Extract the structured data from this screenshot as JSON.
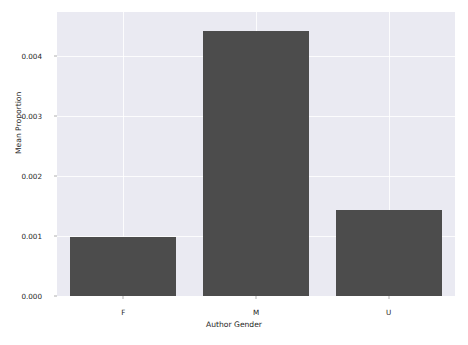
{
  "chart_data": {
    "type": "bar",
    "title": "",
    "xlabel": "Author Gender",
    "ylabel": "Mean Proportion",
    "categories": [
      "F",
      "M",
      "U"
    ],
    "values": [
      0.00098,
      0.00442,
      0.00143
    ],
    "series": [
      {
        "name": "Mean Proportion",
        "values": [
          0.00098,
          0.00442,
          0.00143
        ]
      }
    ],
    "ylim": [
      0.0,
      0.00473
    ],
    "xlim": [
      -0.5,
      2.5
    ],
    "yticks": [
      0.0,
      0.001,
      0.002,
      0.003,
      0.004
    ],
    "ytick_labels": [
      "0.000",
      "0.001",
      "0.002",
      "0.003",
      "0.004"
    ],
    "xtick_labels": [
      "F",
      "M",
      "U"
    ],
    "grid": true,
    "grid_axis": "both",
    "legend": false,
    "legend_position": "none",
    "bar_color": "#4c4c4c",
    "plot_background": "#eaeaf2",
    "figure_background": "#ffffff",
    "gridline_color": "#ffffff",
    "tick_color": "#262626"
  }
}
